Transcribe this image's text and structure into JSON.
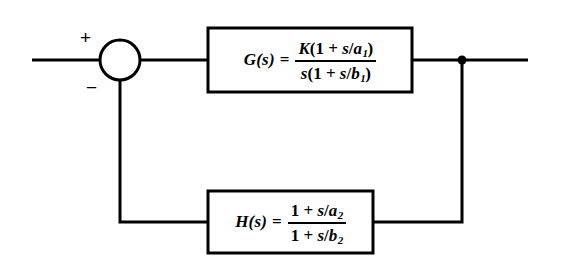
{
  "diagram": {
    "type": "control-system-block-diagram",
    "background_color": "#ffffff",
    "line_color": "#000000",
    "summing_junction": {
      "name": "summing-junction",
      "shape": "circle",
      "center_x": 120,
      "center_y": 60,
      "radius": 20,
      "positive_sign": "+",
      "negative_sign": "−"
    },
    "forward_block": {
      "name": "forward-transfer-function-block",
      "lhs": "G(s)",
      "equals": "=",
      "numerator_parts": [
        "K",
        "(1 + ",
        "s",
        "/",
        "a",
        "1",
        ")"
      ],
      "denominator_parts": [
        "s",
        "(1 + ",
        "s",
        "/",
        "b",
        "1",
        ")"
      ],
      "numerator_text": "K(1 + s/a1)",
      "denominator_text": "s(1 + s/b1)",
      "x": 208,
      "y": 28,
      "width": 204,
      "height": 64
    },
    "feedback_block": {
      "name": "feedback-transfer-function-block",
      "lhs": "H(s)",
      "equals": "=",
      "numerator_text": "1 + s/a2",
      "denominator_text": "1 + s/b2",
      "x": 208,
      "y": 191,
      "width": 165,
      "height": 62
    },
    "takeoff_node": {
      "name": "takeoff-node",
      "x": 462,
      "y": 60,
      "radius": 4.5
    },
    "wires": {
      "input_line": "M32,60 L100,60",
      "sum_to_g": "M140,60 L208,60",
      "g_to_node": "M412,60 L462,60",
      "node_to_output": "M462,60 L528,60",
      "node_down": "M462,60 L462,222",
      "node_to_h": "M462,222 L373,222",
      "h_to_left": "M208,222 L120,222",
      "left_up_to_sum": "M120,222 L120,80"
    }
  }
}
